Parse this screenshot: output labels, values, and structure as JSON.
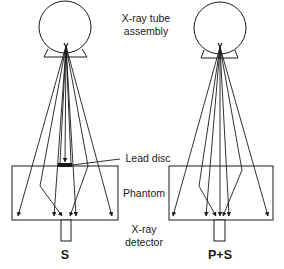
{
  "labels": {
    "tube_line1": "X-ray tube",
    "tube_line2": "assembly",
    "lead_disc": "Lead disc",
    "phantom": "Phantom",
    "detector_line1": "X-ray",
    "detector_line2": "detector"
  },
  "panels": [
    {
      "id": "left",
      "caption": "S",
      "has_lead_disc": true
    },
    {
      "id": "right",
      "caption": "P+S",
      "has_lead_disc": false
    }
  ],
  "colors": {
    "stroke": "#1a1a1a",
    "background": "#ffffff"
  }
}
